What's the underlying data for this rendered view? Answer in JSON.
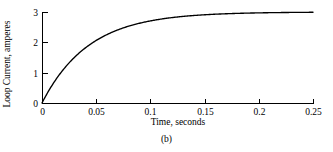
{
  "figure": {
    "caption": "(b)"
  },
  "chart_data": {
    "type": "line",
    "title": "",
    "xlabel": "Time, seconds",
    "ylabel": "Loop Current, amperes",
    "xlim": [
      0,
      0.25
    ],
    "ylim": [
      0,
      3
    ],
    "grid": false,
    "legend": null,
    "xticks": [
      0,
      0.05,
      0.1,
      0.15,
      0.2,
      0.25
    ],
    "xticklabels": [
      "0",
      "0.05",
      "0.1",
      "0.15",
      "0.2",
      "0.25"
    ],
    "yticks": [
      0,
      1,
      2,
      3
    ],
    "yticklabels": [
      "0",
      "1",
      "2",
      "3"
    ],
    "series": [
      {
        "name": "Loop current",
        "description": "Exponential rise to steady state 3 A, time constant about 0.043 s",
        "steady_state": 3,
        "time_constant": 0.043,
        "x": [
          0,
          0.005,
          0.01,
          0.015,
          0.02,
          0.025,
          0.03,
          0.035,
          0.04,
          0.045,
          0.05,
          0.06,
          0.07,
          0.08,
          0.09,
          0.1,
          0.11,
          0.12,
          0.13,
          0.14,
          0.15,
          0.16,
          0.17,
          0.18,
          0.19,
          0.2,
          0.21,
          0.22,
          0.23,
          0.24,
          0.25
        ],
        "y": [
          0.0,
          0.32,
          0.62,
          0.89,
          1.14,
          1.36,
          1.56,
          1.75,
          1.91,
          2.06,
          2.19,
          2.42,
          2.6,
          2.74,
          2.85,
          2.93,
          2.99,
          3.04,
          3.08,
          3.11,
          3.13,
          3.15,
          3.16,
          3.17,
          3.18,
          3.18,
          3.19,
          3.19,
          3.19,
          3.2,
          3.2
        ]
      }
    ]
  },
  "geometry": {
    "origin_x": 42,
    "origin_y": 103,
    "x_end": 313,
    "y_top": 12
  }
}
